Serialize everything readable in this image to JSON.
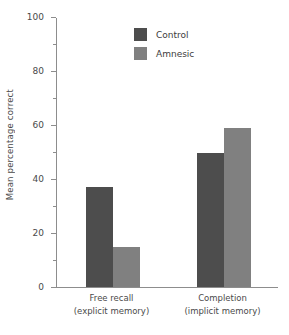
{
  "chart_data": {
    "type": "bar",
    "title": "",
    "xlabel": "",
    "ylabel": "Mean percentage correct",
    "categories": [
      "Free recall\n(explicit memory)",
      "Completion\n(implicit memory)"
    ],
    "category_lines": [
      [
        "Free recall",
        "(explicit memory)"
      ],
      [
        "Completion",
        "(implicit memory)"
      ]
    ],
    "series": [
      {
        "name": "Control",
        "values": [
          37,
          50
        ],
        "color": "#4d4d4d"
      },
      {
        "name": "Amnesic",
        "values": [
          15,
          59
        ],
        "color": "#808080"
      }
    ],
    "ylim": [
      0,
      100
    ],
    "ytick_labels": [
      "0",
      "20",
      "40",
      "60",
      "80",
      "100"
    ],
    "ytick_values": [
      0,
      20,
      40,
      60,
      80,
      100
    ],
    "yminor_values": [
      10,
      30,
      50,
      70,
      90
    ],
    "grid": false,
    "legend_position": "top-center"
  },
  "legend": {
    "entries": [
      {
        "label": "Control",
        "color": "#4d4d4d"
      },
      {
        "label": "Amnesic",
        "color": "#808080"
      }
    ]
  },
  "axes": {
    "y_title": "Mean percentage correct"
  }
}
